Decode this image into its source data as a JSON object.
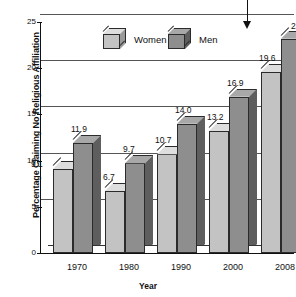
{
  "chart_data": {
    "type": "bar",
    "title": "",
    "xlabel": "Year",
    "ylabel": "Percentage Claiming No Religious Affiliation",
    "categories": [
      "1970",
      "1980",
      "1990",
      "2000",
      "2008"
    ],
    "series": [
      {
        "name": "Women",
        "values": [
          9.1,
          6.7,
          10.7,
          13.2,
          19.6
        ],
        "color": "#c3c3c3"
      },
      {
        "name": "Men",
        "values": [
          11.9,
          9.7,
          14.0,
          16.9,
          23.2
        ],
        "color": "#8e8e8e"
      }
    ],
    "value_labels": {
      "Women": [
        "9.1",
        "6.7",
        "10.7",
        "13.2",
        "19.6"
      ],
      "Men": [
        "11.9",
        "9.7",
        "14.0",
        "16.9",
        "23.2"
      ]
    },
    "ylim": [
      0,
      25
    ],
    "yticks": [
      "0",
      "5",
      "10",
      "15",
      "20",
      "25"
    ],
    "grid": "horizontal",
    "legend_position": "top-center",
    "style": "3d-column",
    "annotation": {
      "type": "down-arrow",
      "target": "2008 Men bar (23.2)"
    }
  },
  "legend": {
    "items": [
      {
        "label": "Women",
        "swatch": "cube-light-icon"
      },
      {
        "label": "Men",
        "swatch": "cube-dark-icon"
      }
    ]
  },
  "axes": {
    "y_title": "Percentage Claiming No Religious Affiliation",
    "x_title": "Year"
  }
}
